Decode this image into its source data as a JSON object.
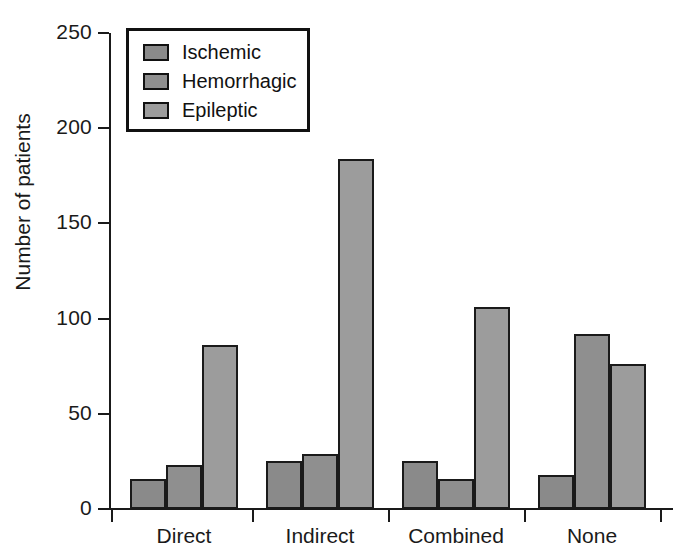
{
  "chart_data": {
    "type": "bar",
    "title": "",
    "xlabel": "",
    "ylabel": "Number of patients",
    "ylim": [
      0,
      250
    ],
    "yticks": [
      0,
      50,
      100,
      150,
      200,
      250
    ],
    "grid": false,
    "legend_position": "upper-left-inside",
    "categories": [
      "Direct",
      "Indirect",
      "Combined",
      "None"
    ],
    "series": [
      {
        "name": "Ischemic",
        "color": "#8a8a8a",
        "values": [
          16,
          25,
          25,
          18
        ]
      },
      {
        "name": "Hemorrhagic",
        "color": "#8f8f8f",
        "values": [
          23,
          29,
          16,
          92
        ]
      },
      {
        "name": "Epileptic",
        "color": "#9c9c9c",
        "values": [
          86,
          184,
          106,
          76
        ]
      }
    ]
  },
  "axis": {
    "y_title": "Number of patients",
    "y_tick_labels": [
      "250",
      "200",
      "150",
      "100",
      "50",
      "0"
    ],
    "x_tick_labels": [
      "Direct",
      "Indirect",
      "Combined",
      "None"
    ]
  },
  "legend": {
    "items": [
      {
        "label": "Ischemic"
      },
      {
        "label": "Hemorrhagic"
      },
      {
        "label": "Epileptic"
      }
    ]
  },
  "colors": {
    "axis": "#1a1a1a",
    "bar_outline": "#1a1a1a",
    "background": "#ffffff",
    "series_1": "#8a8a8a",
    "series_2": "#8f8f8f",
    "series_3": "#9c9c9c"
  }
}
